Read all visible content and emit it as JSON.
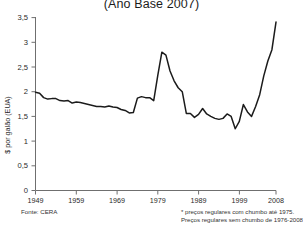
{
  "chart_title": "(Año Base 2007)",
  "axes": {
    "ylabel": "$ por galão (EUA)",
    "yticks": [
      "0",
      "0,5",
      "1",
      "1,5",
      "2",
      "2,5",
      "3",
      "3,5"
    ],
    "xticks": [
      "1949",
      "1959",
      "1969",
      "1979",
      "1989",
      "1999",
      "2008"
    ]
  },
  "notes": {
    "source": "Fonte: CERA",
    "footnote_1": "* preços regulares com chumbo até 1975.",
    "footnote_2": "Preços regulares sem chumbo de 1976-2008."
  },
  "colors": {
    "line": "#1b1b1b",
    "axis": "#6f6f6f",
    "background": "#ffffff",
    "text": "#2a2a2a"
  },
  "chart_data": {
    "type": "line",
    "title": "(Año Base 2007)",
    "xlabel": "",
    "ylabel": "$ por galão (EUA)",
    "xlim": [
      1949,
      2008
    ],
    "ylim": [
      0,
      3.5
    ],
    "grid": false,
    "legend": null,
    "series": [
      {
        "name": "Preço real da gasolina (US$ por galão, base 2007)",
        "x": [
          1949,
          1950,
          1951,
          1952,
          1953,
          1954,
          1955,
          1956,
          1957,
          1958,
          1959,
          1960,
          1961,
          1962,
          1963,
          1964,
          1965,
          1966,
          1967,
          1968,
          1969,
          1970,
          1971,
          1972,
          1973,
          1974,
          1975,
          1976,
          1977,
          1978,
          1979,
          1980,
          1981,
          1982,
          1983,
          1984,
          1985,
          1986,
          1987,
          1988,
          1989,
          1990,
          1991,
          1992,
          1993,
          1994,
          1995,
          1996,
          1997,
          1998,
          1999,
          2000,
          2001,
          2002,
          2003,
          2004,
          2005,
          2006,
          2007,
          2008
        ],
        "y": [
          1.99,
          1.97,
          1.88,
          1.85,
          1.86,
          1.86,
          1.82,
          1.81,
          1.82,
          1.77,
          1.79,
          1.78,
          1.76,
          1.74,
          1.72,
          1.7,
          1.7,
          1.69,
          1.71,
          1.69,
          1.68,
          1.64,
          1.62,
          1.57,
          1.58,
          1.87,
          1.9,
          1.88,
          1.88,
          1.82,
          2.33,
          2.8,
          2.74,
          2.42,
          2.22,
          2.08,
          2.0,
          1.56,
          1.56,
          1.48,
          1.54,
          1.66,
          1.55,
          1.5,
          1.46,
          1.44,
          1.46,
          1.55,
          1.5,
          1.25,
          1.4,
          1.74,
          1.59,
          1.5,
          1.7,
          1.94,
          2.32,
          2.62,
          2.85,
          3.41
        ]
      }
    ]
  }
}
